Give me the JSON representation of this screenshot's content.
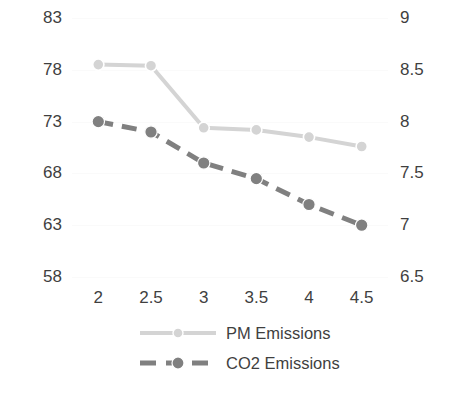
{
  "chart_data": {
    "type": "line",
    "title": "",
    "xlabel": "",
    "ylabel": "",
    "x": [
      2,
      2.5,
      3,
      3.5,
      4,
      4.5
    ],
    "x_tick_labels": [
      "2",
      "2.5",
      "3",
      "3.5",
      "4",
      "4.5"
    ],
    "grid": true,
    "legend_position": "bottom",
    "axes": {
      "left": {
        "ticks": [
          83,
          78,
          73,
          68,
          63,
          58
        ],
        "tick_labels": [
          "83",
          "78",
          "73",
          "68",
          "63",
          "58"
        ],
        "ylim": [
          58,
          83
        ]
      },
      "right": {
        "ticks": [
          9,
          8.5,
          8,
          7.5,
          7,
          6.5
        ],
        "tick_labels": [
          "9",
          "8.5",
          "8",
          "7.5",
          "7",
          "6.5"
        ],
        "ylim": [
          6.5,
          9
        ]
      }
    },
    "series": [
      {
        "name": "PM Emissions",
        "axis": "left",
        "color": "#d4d4d4",
        "marker": "circle",
        "linestyle": "solid",
        "values": [
          78.5,
          78.4,
          72.4,
          72.2,
          71.5,
          70.6
        ]
      },
      {
        "name": "CO2 Emissions",
        "axis": "right",
        "color": "#808080",
        "marker": "circle",
        "linestyle": "dashed",
        "values": [
          8.0,
          7.9,
          7.6,
          7.45,
          7.2,
          7.0
        ]
      }
    ]
  },
  "legend": {
    "items": [
      {
        "label": "PM Emissions"
      },
      {
        "label": "CO2 Emissions"
      }
    ]
  },
  "colors": {
    "pm_series": "#d4d4d4",
    "co2_series": "#808080",
    "text": "#3f3f3f",
    "background": "#ffffff",
    "gridline": "#fafafa"
  }
}
